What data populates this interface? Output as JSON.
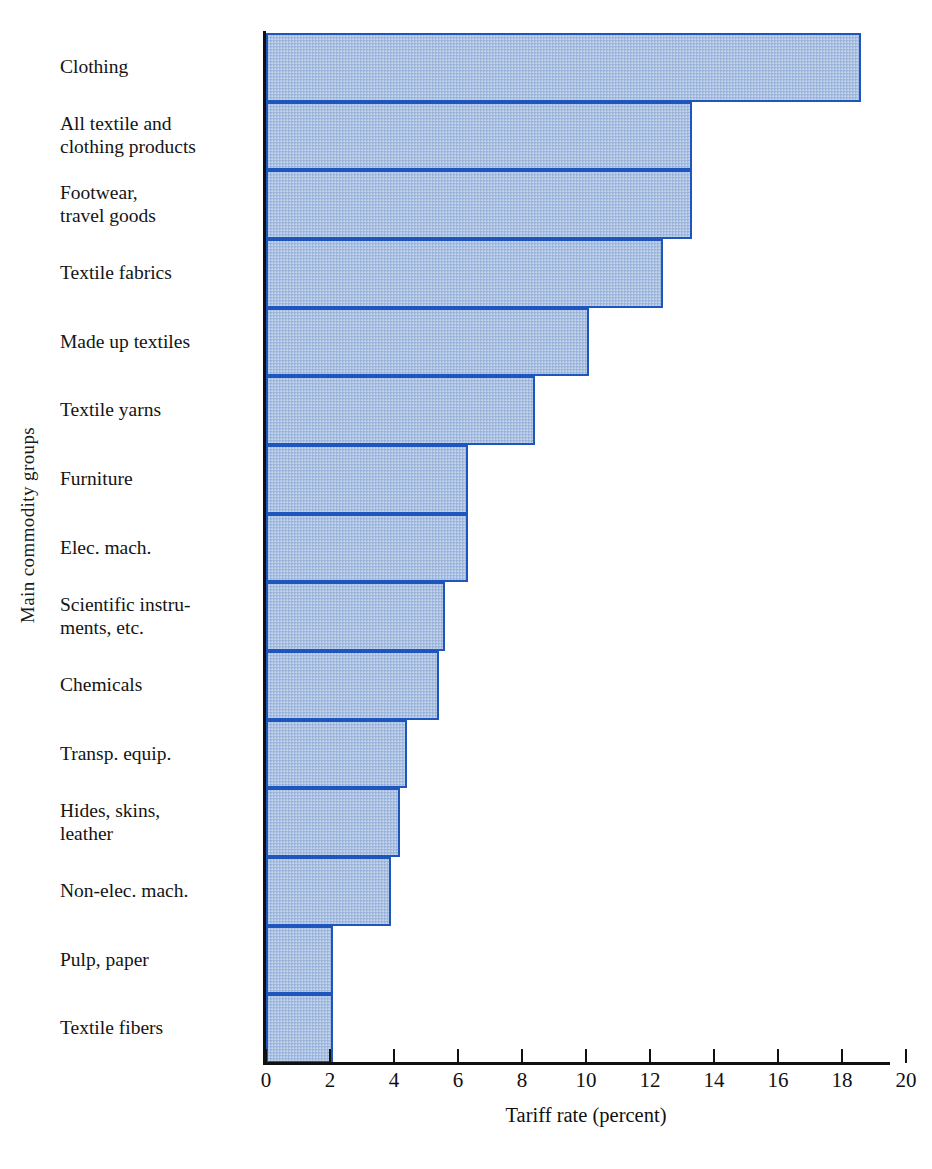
{
  "chart_data": {
    "type": "bar",
    "orientation": "horizontal",
    "title": "",
    "xlabel": "Tariff rate (percent)",
    "ylabel": "Main commodity groups",
    "xlim": [
      0,
      20
    ],
    "xticks": [
      0,
      2,
      4,
      6,
      8,
      10,
      12,
      14,
      16,
      18,
      20
    ],
    "xtick_labels": [
      "0",
      "2",
      "4",
      "6",
      "8",
      "10",
      "12",
      "14",
      "16",
      "18",
      "20"
    ],
    "grid": false,
    "legend": null,
    "bar_fill_color": "#a9c0e2",
    "bar_border_color": "#1f56bd",
    "categories": [
      "Clothing",
      "All textile and\nclothing products",
      "Footwear,\ntravel goods",
      "Textile fabrics",
      "Made up textiles",
      "Textile yarns",
      "Furniture",
      "Elec. mach.",
      "Scientific instru-\nments, etc.",
      "Chemicals",
      "Transp. equip.",
      "Hides, skins,\nleather",
      "Non-elec. mach.",
      "Pulp, paper",
      "Textile fibers"
    ],
    "values": [
      18.6,
      13.3,
      13.3,
      12.4,
      10.1,
      8.4,
      6.3,
      6.3,
      5.6,
      5.4,
      4.4,
      4.2,
      3.9,
      2.1,
      2.1
    ]
  }
}
